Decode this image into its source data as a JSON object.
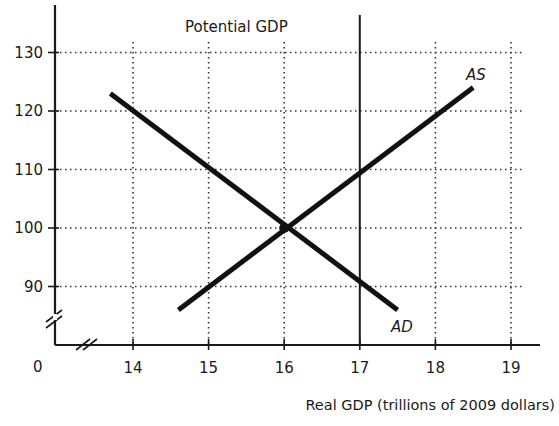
{
  "chart_data": {
    "type": "line",
    "title": "",
    "xlabel": "Real GDP (trillions of 2009 dollars)",
    "ylabel": "",
    "origin_label": "0",
    "x_ticks": [
      14,
      15,
      16,
      17,
      18,
      19
    ],
    "y_ticks": [
      90,
      100,
      110,
      120,
      130
    ],
    "xlim": [
      13.3,
      19.4
    ],
    "ylim": [
      84,
      136
    ],
    "axis_breaks": {
      "x": true,
      "y": true
    },
    "grid": "dotted",
    "series": [
      {
        "name": "AD",
        "label": "AD",
        "points": [
          [
            13.7,
            123
          ],
          [
            17.5,
            86
          ]
        ]
      },
      {
        "name": "AS",
        "label": "AS",
        "points": [
          [
            14.6,
            86
          ],
          [
            18.5,
            124
          ]
        ]
      }
    ],
    "vertical_lines": [
      {
        "name": "Potential GDP",
        "label": "Potential GDP",
        "x": 17
      }
    ],
    "equilibrium": {
      "x": 16,
      "y": 100
    }
  }
}
